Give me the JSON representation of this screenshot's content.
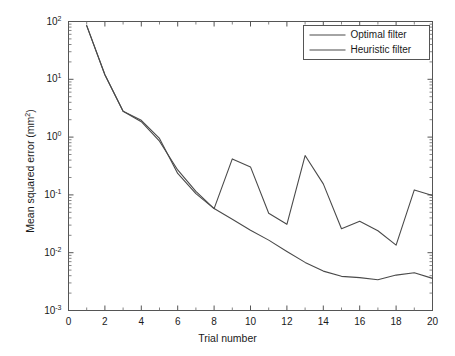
{
  "chart_data": {
    "type": "line",
    "title": "",
    "xlabel": "Trial number",
    "ylabel": "Mean squared error (mm²)",
    "yscale": "log",
    "xlim": [
      0,
      20
    ],
    "ylim": [
      0.001,
      100
    ],
    "grid": false,
    "legend_position": "top-right",
    "x": [
      1,
      2,
      3,
      4,
      5,
      6,
      7,
      8,
      9,
      10,
      11,
      12,
      13,
      14,
      15,
      16,
      17,
      18,
      19,
      20
    ],
    "xticks": [
      0,
      2,
      4,
      6,
      8,
      10,
      12,
      14,
      16,
      18,
      20
    ],
    "xtick_labels": [
      "0",
      "2",
      "4",
      "6",
      "8",
      "10",
      "12",
      "14",
      "16",
      "18",
      "20"
    ],
    "yticks": [
      0.001,
      0.01,
      0.1,
      1,
      10,
      100
    ],
    "ytick_labels": [
      "10-3",
      "10-2",
      "10-1",
      "100",
      "101",
      "102"
    ],
    "ytick_mantissas": [
      "10",
      "10",
      "10",
      "10",
      "10",
      "10"
    ],
    "ytick_exponents": [
      "-3",
      "-2",
      "-1",
      "0",
      "1",
      "2"
    ],
    "series": [
      {
        "name": "Optimal filter",
        "color": "#4a4a4a",
        "values": [
          85,
          12,
          2.8,
          1.85,
          0.85,
          0.27,
          0.115,
          0.058,
          0.038,
          0.0245,
          0.0165,
          0.0105,
          0.0068,
          0.0048,
          0.0039,
          0.0037,
          0.0034,
          0.0041,
          0.0045,
          0.0036
        ]
      },
      {
        "name": "Heuristic filter",
        "color": "#4a4a4a",
        "values": [
          85,
          12,
          2.8,
          1.95,
          0.95,
          0.235,
          0.105,
          0.058,
          0.42,
          0.305,
          0.048,
          0.031,
          0.48,
          0.155,
          0.026,
          0.035,
          0.024,
          0.0135,
          0.122,
          0.098
        ]
      }
    ]
  },
  "legend": {
    "entries": [
      {
        "label": "Optimal filter"
      },
      {
        "label": "Heuristic filter"
      }
    ]
  },
  "axes": {
    "x_title": "Trial number",
    "y_title_text": "Mean squared error (mm",
    "y_title_exp": "2",
    "y_title_close": ")"
  }
}
